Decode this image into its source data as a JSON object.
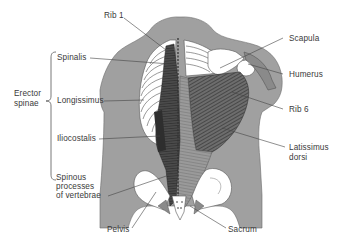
{
  "diagram": {
    "colors": {
      "skin": "#a0a0a0",
      "bone": "#ffffff",
      "muscle_dark": "#4a4a4a",
      "muscle_mid": "#8a8a8a",
      "outline": "#555555",
      "leader": "#444444",
      "text": "#3a3a3a"
    },
    "group_label": {
      "line1": "Erector",
      "line2": "spinae",
      "members": [
        "Spinalis",
        "Longissimus",
        "Iliocostalis"
      ]
    },
    "labels": {
      "rib1": "Rib 1",
      "spinalis": "Spinalis",
      "longissimus": "Longissimus",
      "iliocostalis": "Iliocostalis",
      "spinous_1": "Spinous",
      "spinous_2": "processes",
      "spinous_3": "of vertebrae",
      "pelvis": "Pelvis",
      "scapula": "Scapula",
      "humerus": "Humerus",
      "rib6": "Rib 6",
      "latissimus_1": "Latissimus",
      "latissimus_2": "dorsi",
      "sacrum": "Sacrum"
    }
  }
}
